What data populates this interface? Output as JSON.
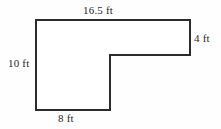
{
  "figure": {
    "name": "L-shaped polygon with dimension labels",
    "shape_type": "l-shaped-polygon",
    "stroke_color": "#2b2b2b",
    "fill_color": "#ffffff",
    "background_color": "#fefefe",
    "text_color": "#272727",
    "stroke_width": 2,
    "vertices": [
      {
        "x": 36,
        "y": 20
      },
      {
        "x": 190,
        "y": 20
      },
      {
        "x": 190,
        "y": 55
      },
      {
        "x": 110,
        "y": 55
      },
      {
        "x": 110,
        "y": 110
      },
      {
        "x": 36,
        "y": 110
      }
    ],
    "polygon_points": "36,20 190,20 190,55 110,55 110,110 36,110",
    "labels": {
      "top": "16.5 ft",
      "right": "4 ft",
      "left": "10 ft",
      "bottom": "8 ft"
    },
    "unit": "ft",
    "dimensions": [
      {
        "side": "top",
        "value": 16.5,
        "unit": "ft",
        "text": "16.5 ft"
      },
      {
        "side": "right",
        "value": 4,
        "unit": "ft",
        "text": "4 ft"
      },
      {
        "side": "left",
        "value": 10,
        "unit": "ft",
        "text": "10 ft"
      },
      {
        "side": "bottom",
        "value": 8,
        "unit": "ft",
        "text": "8 ft"
      }
    ]
  }
}
